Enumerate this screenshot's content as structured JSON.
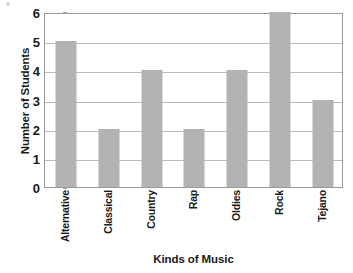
{
  "chart_data": {
    "type": "bar",
    "title": "",
    "xlabel": "Kinds of Music",
    "ylabel": "Number of Students",
    "categories": [
      "Alternative",
      "Classical",
      "Country",
      "Rap",
      "Oldies",
      "Rock",
      "Tejano"
    ],
    "values": [
      5,
      2,
      4,
      2,
      4,
      6,
      3
    ],
    "ylim": [
      0,
      6
    ],
    "y_ticks": [
      0,
      1,
      2,
      3,
      4,
      5,
      6
    ],
    "y_tick_labels": [
      "0",
      "1",
      "2",
      "3",
      "4",
      "5",
      "6"
    ],
    "grid": "horizontal",
    "legend": "none",
    "bar_color": "#b3b3b3",
    "axis_color": "#9a9a9a",
    "gridline_color": "#b9b9b9",
    "text_color": "#1a1a1a"
  }
}
